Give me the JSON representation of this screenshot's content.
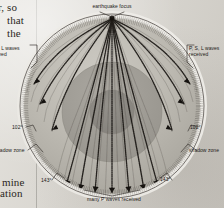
{
  "figure": {
    "type": "seismic-ray-diagram",
    "source_context": "textbook page scan",
    "labels": {
      "focus": "earthquake focus",
      "left_waves": ", S, L waves\nceived",
      "left_waves_full": "P, S, L waves received",
      "right_waves": "P, S, L waves\nreceived",
      "shadow_zone_left": "hadow zone",
      "shadow_zone_left_full": "shadow zone",
      "shadow_zone_right": "shadow zone",
      "bottom": "many P waves received"
    },
    "angles": {
      "inner_left": "102°",
      "inner_right": "102°",
      "outer_left": "143°",
      "outer_right": "143°"
    },
    "layers": [
      {
        "name": "mantle",
        "color": "#b9b6ae"
      },
      {
        "name": "outer-core",
        "color": "#9e9b94"
      },
      {
        "name": "inner-core",
        "color": "#8c8982"
      }
    ],
    "colors": {
      "paper": "#dcd9d2",
      "surface_ring": "#f2f0ec",
      "ray_path": "#231f1c",
      "outline": "#4a4641",
      "label_text": "#1d1a17"
    },
    "geometry": {
      "center_x": 112,
      "center_y": 106,
      "earth_radius": 92,
      "mantle_radius": 88,
      "outer_core_radius": 50,
      "inner_core_radius": 22,
      "focus_x": 112,
      "focus_y": 18
    }
  },
  "body_text": {
    "frag_1": "r, so",
    "frag_2": "that",
    "frag_3": "the",
    "frag_4": "mine",
    "frag_5": "ation"
  }
}
